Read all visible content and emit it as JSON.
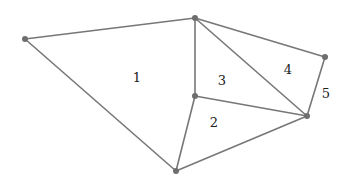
{
  "diagram": {
    "title_fragment": "(part ...)",
    "vertices": [
      {
        "id": "A",
        "x": 25,
        "y": 39
      },
      {
        "id": "B",
        "x": 195,
        "y": 18
      },
      {
        "id": "C",
        "x": 325,
        "y": 57
      },
      {
        "id": "D",
        "x": 307,
        "y": 116
      },
      {
        "id": "E",
        "x": 195,
        "y": 96
      },
      {
        "id": "F",
        "x": 176,
        "y": 171
      }
    ],
    "edges": [
      [
        "A",
        "B"
      ],
      [
        "A",
        "F"
      ],
      [
        "B",
        "C"
      ],
      [
        "C",
        "D"
      ],
      [
        "B",
        "D"
      ],
      [
        "B",
        "E"
      ],
      [
        "E",
        "D"
      ],
      [
        "E",
        "F"
      ],
      [
        "F",
        "D"
      ]
    ],
    "regions": [
      {
        "label": "1",
        "x": 137,
        "y": 77
      },
      {
        "label": "2",
        "x": 214,
        "y": 122
      },
      {
        "label": "3",
        "x": 222,
        "y": 80
      },
      {
        "label": "4",
        "x": 288,
        "y": 69
      },
      {
        "label": "5",
        "x": 326,
        "y": 93
      }
    ],
    "colors": {
      "edge": "#777777",
      "vertex": "#6e6e6e",
      "label": "#222222"
    }
  }
}
